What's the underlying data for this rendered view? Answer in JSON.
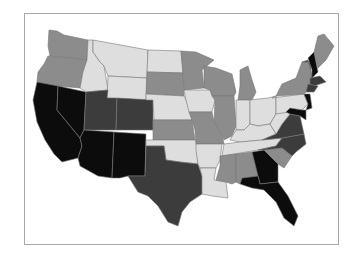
{
  "map": {
    "type": "choropleth",
    "region": "Contiguous United States",
    "palette": {
      "light": "#dedede",
      "medium": "#8c8c8c",
      "dark": "#3c3c3c",
      "black": "#0c0c0c"
    },
    "states": {
      "WA": "medium",
      "OR": "medium",
      "CA": "black",
      "NV": "black",
      "ID": "light",
      "MT": "light",
      "WY": "light",
      "UT": "dark",
      "CO": "dark",
      "AZ": "black",
      "NM": "black",
      "ND": "light",
      "SD": "medium",
      "NE": "light",
      "KS": "medium",
      "OK": "light",
      "TX": "dark",
      "MN": "medium",
      "IA": "light",
      "MO": "medium",
      "AR": "light",
      "LA": "light",
      "WI": "medium",
      "IL": "medium",
      "MI": "medium",
      "IN": "light",
      "OH": "light",
      "KY": "light",
      "TN": "light",
      "MS": "medium",
      "AL": "medium",
      "GA": "black",
      "FL": "black",
      "SC": "medium",
      "NC": "dark",
      "VA": "dark",
      "WV": "light",
      "PA": "light",
      "NY": "medium",
      "VT": "dark",
      "NH": "black",
      "ME": "medium",
      "MA": "dark",
      "CT": "dark",
      "RI": "dark",
      "NJ": "black",
      "DE": "black",
      "MD": "black"
    }
  }
}
